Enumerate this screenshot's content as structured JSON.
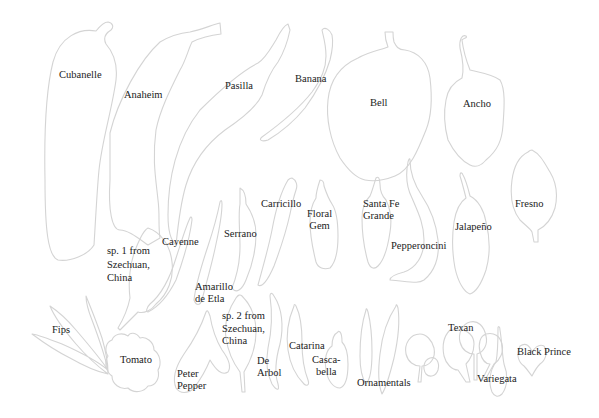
{
  "diagram": {
    "stroke_color": "#d4d4d4",
    "text_color": "#222222",
    "peppers": [
      {
        "id": "cubanelle",
        "label": "Cubanelle"
      },
      {
        "id": "anaheim",
        "label": "Anaheim"
      },
      {
        "id": "pasilla",
        "label": "Pasilla"
      },
      {
        "id": "banana",
        "label": "Banana"
      },
      {
        "id": "bell",
        "label": "Bell"
      },
      {
        "id": "ancho",
        "label": "Ancho"
      },
      {
        "id": "fresno",
        "label": "Fresno"
      },
      {
        "id": "carricillo",
        "label": "Carricillo"
      },
      {
        "id": "floral-gem",
        "label": "Floral\nGem"
      },
      {
        "id": "santa-fe-grande",
        "label": "Santa Fe\nGrande"
      },
      {
        "id": "pepperoncini",
        "label": "Pepperoncini"
      },
      {
        "id": "jalapeno",
        "label": "Jalapeño"
      },
      {
        "id": "serrano",
        "label": "Serrano"
      },
      {
        "id": "cayenne",
        "label": "Cayenne"
      },
      {
        "id": "sp1-szechuan",
        "label": "sp. 1 from\nSzechuan,\nChina"
      },
      {
        "id": "amarillo-de-etla",
        "label": "Amarillo\nde Etla"
      },
      {
        "id": "sp2-szechuan",
        "label": "sp. 2 from\nSzechuan,\nChina"
      },
      {
        "id": "fips",
        "label": "Fips"
      },
      {
        "id": "tomato",
        "label": "Tomato"
      },
      {
        "id": "peter-pepper",
        "label": "Peter\nPepper"
      },
      {
        "id": "de-arbol",
        "label": "De\nArbol"
      },
      {
        "id": "catarina",
        "label": "Catarina"
      },
      {
        "id": "cascabella",
        "label": "Casca-\nbella"
      },
      {
        "id": "ornamentals",
        "label": "Ornamentals"
      },
      {
        "id": "texan",
        "label": "Texan"
      },
      {
        "id": "variegata",
        "label": "Variegata"
      },
      {
        "id": "black-prince",
        "label": "Black Prince"
      }
    ]
  }
}
